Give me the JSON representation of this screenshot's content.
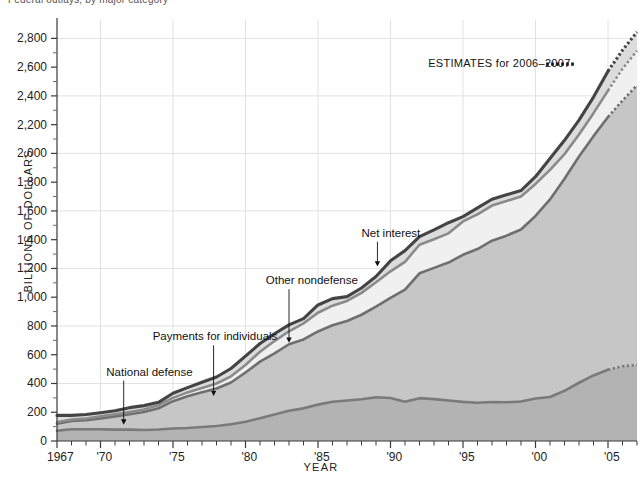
{
  "chart_data": {
    "type": "area",
    "title": "Federal outlays, by major category",
    "xlabel": "YEAR",
    "ylabel": "BILLIONS OF DOLLARS",
    "ylim": [
      0,
      2900
    ],
    "xlim": [
      1967,
      2007
    ],
    "grid": "horizontal every 400, vertical every 5 years",
    "stacked": true,
    "legend_position": "inline annotations with leader arrows",
    "y_ticks": [
      "0",
      "200",
      "400",
      "600",
      "800",
      "1,000",
      "1,200",
      "1,400",
      "1,600",
      "1,800",
      "2,000",
      "2,200",
      "2,400",
      "2,600",
      "2,800"
    ],
    "y_tick_values": [
      0,
      200,
      400,
      600,
      800,
      1000,
      1200,
      1400,
      1600,
      1800,
      2000,
      2200,
      2400,
      2600,
      2800
    ],
    "y_gridline_values": [
      400,
      800,
      1200,
      1600,
      2000,
      2400,
      2800
    ],
    "x_ticks": [
      "1967",
      "'70",
      "'75",
      "'80",
      "'85",
      "'90",
      "'95",
      "'00",
      "'05"
    ],
    "x_tick_values": [
      1967,
      1970,
      1975,
      1980,
      1985,
      1990,
      1995,
      2000,
      2005
    ],
    "x": [
      1967,
      1968,
      1969,
      1970,
      1971,
      1972,
      1973,
      1974,
      1975,
      1976,
      1977,
      1978,
      1979,
      1980,
      1981,
      1982,
      1983,
      1984,
      1985,
      1986,
      1987,
      1988,
      1989,
      1990,
      1991,
      1992,
      1993,
      1994,
      1995,
      1996,
      1997,
      1998,
      1999,
      2000,
      2001,
      2002,
      2003,
      2004,
      2005,
      2006,
      2007
    ],
    "series": [
      {
        "name": "National defense",
        "order": 1,
        "fill_color": "#b3b3b3",
        "line_color": "#7a7a7a",
        "values": [
          71,
          82,
          82,
          82,
          79,
          79,
          77,
          80,
          87,
          90,
          97,
          104,
          116,
          134,
          158,
          185,
          210,
          227,
          253,
          273,
          282,
          290,
          304,
          299,
          273,
          298,
          291,
          282,
          272,
          266,
          271,
          269,
          275,
          295,
          306,
          349,
          405,
          456,
          495,
          520,
          529
        ]
      },
      {
        "name": "Payments for individuals",
        "order": 2,
        "fill_color": "#c6c6c6",
        "line_color": "#6f6f6f",
        "values": [
          49,
          57,
          62,
          75,
          92,
          107,
          125,
          148,
          190,
          221,
          242,
          261,
          291,
          342,
          394,
          425,
          463,
          479,
          509,
          532,
          553,
          588,
          631,
          697,
          779,
          868,
          913,
          959,
          1023,
          1069,
          1122,
          1159,
          1196,
          1270,
          1374,
          1475,
          1573,
          1664,
          1758,
          1848,
          1946
        ]
      },
      {
        "name": "Net interest",
        "order": 3,
        "fill_color": "#f0f0f0",
        "line_color": "#8a8a8a",
        "values": [
          10,
          11,
          12,
          14,
          15,
          15,
          17,
          21,
          23,
          27,
          30,
          35,
          43,
          53,
          69,
          85,
          90,
          112,
          130,
          136,
          139,
          152,
          169,
          184,
          194,
          199,
          199,
          203,
          232,
          241,
          244,
          241,
          230,
          223,
          206,
          171,
          153,
          160,
          184,
          220,
          239
        ]
      },
      {
        "name": "Other nondefense",
        "order": 4,
        "fill_color": "#dcdcdc",
        "line_color": "#444444",
        "values": [
          48,
          28,
          28,
          25,
          24,
          31,
          27,
          20,
          32,
          33,
          40,
          45,
          54,
          61,
          57,
          51,
          45,
          33,
          54,
          49,
          30,
          34,
          40,
          73,
          78,
          56,
          65,
          74,
          33,
          45,
          44,
          43,
          41,
          50,
          78,
          96,
          101,
          112,
          135,
          130,
          130
        ]
      }
    ],
    "total_label": "Total outlays (top boundary)",
    "estimate_start_year": 2005,
    "annotations": [
      {
        "id": "national-defense",
        "label": "National defense",
        "text_x": 1970.4,
        "text_y": 455,
        "arrow_to_x": 1971.6,
        "arrow_to_y": 90
      },
      {
        "id": "payments-for-individuals",
        "label": "Payments for individuals",
        "text_x": 1973.6,
        "text_y": 700,
        "arrow_to_x": 1977.8,
        "arrow_to_y": 290
      },
      {
        "id": "other-nondefense",
        "label": "Other nondefense",
        "text_x": 1981.4,
        "text_y": 1090,
        "arrow_to_x": 1983.0,
        "arrow_to_y": 660
      },
      {
        "id": "net-interest",
        "label": "Net interest",
        "text_x": 1988.0,
        "text_y": 1420,
        "arrow_to_x": 1989.1,
        "arrow_to_y": 1190
      }
    ],
    "legend": {
      "estimates_label": "ESTIMATES for 2006–2007",
      "estimates_marker": "dotted-line-swatch",
      "estimates_x": 1992.6,
      "estimates_y": 2600
    }
  }
}
